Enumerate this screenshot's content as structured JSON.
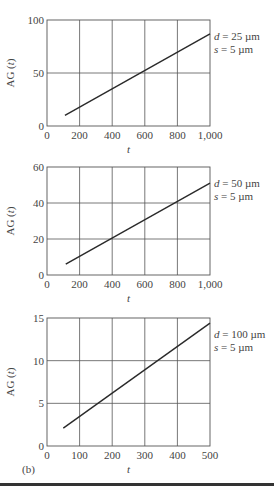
{
  "panel_label": "(b)",
  "chart_data": [
    {
      "type": "line",
      "title": "",
      "xlabel": "t",
      "ylabel": "AG (t)",
      "xlim": [
        0,
        1000
      ],
      "ylim": [
        0,
        100
      ],
      "x_ticks": [
        0,
        200,
        400,
        600,
        800,
        1000
      ],
      "x_tick_labels": [
        "0",
        "200",
        "400",
        "600",
        "800",
        "1,000"
      ],
      "y_ticks": [
        0,
        50,
        100
      ],
      "y_tick_labels": [
        "0",
        "50",
        "100"
      ],
      "grid": true,
      "series": [
        {
          "name": "d = 25 µm, s = 5 µm",
          "x": [
            110,
            1000
          ],
          "y": [
            10,
            87
          ]
        }
      ],
      "annotation": {
        "line1_var": "d",
        "line1_rest": " = 25 µm",
        "line2_var": "s",
        "line2_rest": " = 5 µm"
      }
    },
    {
      "type": "line",
      "title": "",
      "xlabel": "t",
      "ylabel": "AG (t)",
      "xlim": [
        0,
        1000
      ],
      "ylim": [
        0,
        60
      ],
      "x_ticks": [
        0,
        200,
        400,
        600,
        800,
        1000
      ],
      "x_tick_labels": [
        "0",
        "200",
        "400",
        "600",
        "800",
        "1,000"
      ],
      "y_ticks": [
        0,
        20,
        40,
        60
      ],
      "y_tick_labels": [
        "0",
        "20",
        "40",
        "60"
      ],
      "grid": true,
      "series": [
        {
          "name": "d = 50 µm, s = 5 µm",
          "x": [
            115,
            1000
          ],
          "y": [
            6,
            51
          ]
        }
      ],
      "annotation": {
        "line1_var": "d",
        "line1_rest": " = 50 µm",
        "line2_var": "s",
        "line2_rest": " = 5 µm"
      }
    },
    {
      "type": "line",
      "title": "",
      "xlabel": "t",
      "ylabel": "AG (t)",
      "xlim": [
        0,
        500
      ],
      "ylim": [
        0,
        15
      ],
      "x_ticks": [
        0,
        100,
        200,
        300,
        400,
        500
      ],
      "x_tick_labels": [
        "0",
        "100",
        "200",
        "300",
        "400",
        "500"
      ],
      "y_ticks": [
        0,
        5,
        10,
        15
      ],
      "y_tick_labels": [
        "0",
        "5",
        "10",
        "15"
      ],
      "grid": true,
      "series": [
        {
          "name": "d = 100 µm, s = 5 µm",
          "x": [
            50,
            500
          ],
          "y": [
            2.1,
            14.4
          ]
        }
      ],
      "annotation": {
        "line1_var": "d",
        "line1_rest": " = 100 µm",
        "line2_var": "s",
        "line2_rest": " = 5 µm"
      }
    }
  ]
}
